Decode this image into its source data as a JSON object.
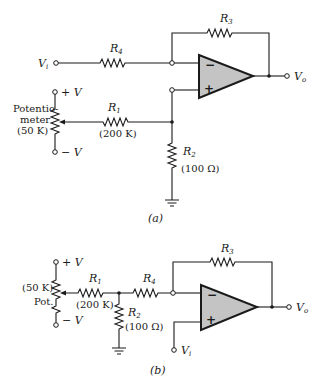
{
  "diagram_a": {
    "caption": "(a)",
    "input_label": "V",
    "input_sub": "i",
    "output_label": "V",
    "output_sub": "o",
    "opamp": {
      "inverting_sign": "−",
      "noninverting_sign": "+"
    },
    "resistors": {
      "R4": {
        "name": "R",
        "sub": "4"
      },
      "R3": {
        "name": "R",
        "sub": "3"
      },
      "R1": {
        "name": "R",
        "sub": "1",
        "value": "(200 K)"
      },
      "R2": {
        "name": "R",
        "sub": "2",
        "value": "(100 Ω)"
      }
    },
    "potentiometer": {
      "label_line1": "Potentio-",
      "label_line2": "meter",
      "value": "(50 K)",
      "plus_supply": "+ V",
      "minus_supply": "− V"
    }
  },
  "diagram_b": {
    "caption": "(b)",
    "input_label": "V",
    "input_sub": "i",
    "output_label": "V",
    "output_sub": "o",
    "opamp": {
      "inverting_sign": "−",
      "noninverting_sign": "+"
    },
    "resistors": {
      "R1": {
        "name": "R",
        "sub": "1",
        "value": "(200 K)"
      },
      "R4": {
        "name": "R",
        "sub": "4"
      },
      "R3": {
        "name": "R",
        "sub": "3"
      },
      "R2": {
        "name": "R",
        "sub": "2",
        "value": "(100 Ω)"
      }
    },
    "potentiometer": {
      "label": "Pot.",
      "value": "(50 K)",
      "plus_supply": "+ V",
      "minus_supply": "− V"
    }
  }
}
